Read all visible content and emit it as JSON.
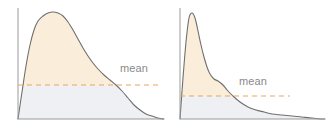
{
  "figure": {
    "background_color": "#ffffff",
    "width": 333,
    "height": 132
  },
  "style": {
    "fill_above_mean": "#faeedb",
    "fill_below_mean": "#eef0f4",
    "curve_stroke": "#6f6f6f",
    "axis_stroke": "#9a9a9a",
    "mean_line_color": "#e8a55c",
    "label_color": "#8a8a8a"
  },
  "chart_data": {
    "type": "area",
    "title": "",
    "subtitle": "",
    "xlabel": "",
    "ylabel": "",
    "grid": false,
    "legend_position": "inline-annotation",
    "panels": [
      {
        "name": "left-distribution",
        "description": "Moderately right-skewed unimodal distribution with broad rounded peak and long right tail",
        "axis": {
          "x_origin": 18,
          "x_end": 164,
          "y_baseline": 119,
          "y_top": 8
        },
        "mean_line": {
          "label": "mean",
          "y": 85,
          "x_start": 18,
          "x_end": 160,
          "dash": "5 4",
          "label_x": 120,
          "label_y": 72
        },
        "x": [
          18,
          22,
          26,
          30,
          34,
          38,
          43,
          48,
          53,
          58,
          63,
          68,
          73,
          78,
          83,
          88,
          93,
          98,
          104,
          110,
          116,
          122,
          128,
          134,
          140,
          146,
          152,
          158,
          164
        ],
        "y": [
          119,
          92,
          66,
          45,
          30,
          21,
          16,
          13,
          12,
          13,
          16,
          22,
          30,
          39,
          48,
          56,
          63,
          69,
          75,
          80,
          85,
          91,
          98,
          105,
          110,
          114,
          116,
          118,
          119
        ]
      },
      {
        "name": "right-distribution",
        "description": "Strongly right-skewed unimodal distribution with narrow sharp peak, small shoulder and very long right tail",
        "axis": {
          "x_origin": 180,
          "x_end": 325,
          "y_baseline": 119,
          "y_top": 8
        },
        "mean_line": {
          "label": "mean",
          "y": 96,
          "x_start": 180,
          "x_end": 290,
          "dash": "5 4",
          "label_x": 239,
          "label_y": 85
        },
        "x": [
          180,
          183,
          186,
          189,
          192,
          195,
          198,
          201,
          204,
          207,
          210,
          214,
          218,
          223,
          228,
          234,
          240,
          248,
          256,
          264,
          272,
          282,
          292,
          302,
          312,
          320,
          325
        ],
        "y": [
          119,
          78,
          42,
          18,
          13,
          18,
          31,
          45,
          57,
          67,
          74,
          79,
          81,
          85,
          91,
          97,
          102,
          107,
          110,
          112,
          114,
          115,
          116,
          117,
          118,
          119,
          119
        ]
      }
    ]
  },
  "annotations": {
    "left_mean_label": "mean",
    "right_mean_label": "mean"
  }
}
